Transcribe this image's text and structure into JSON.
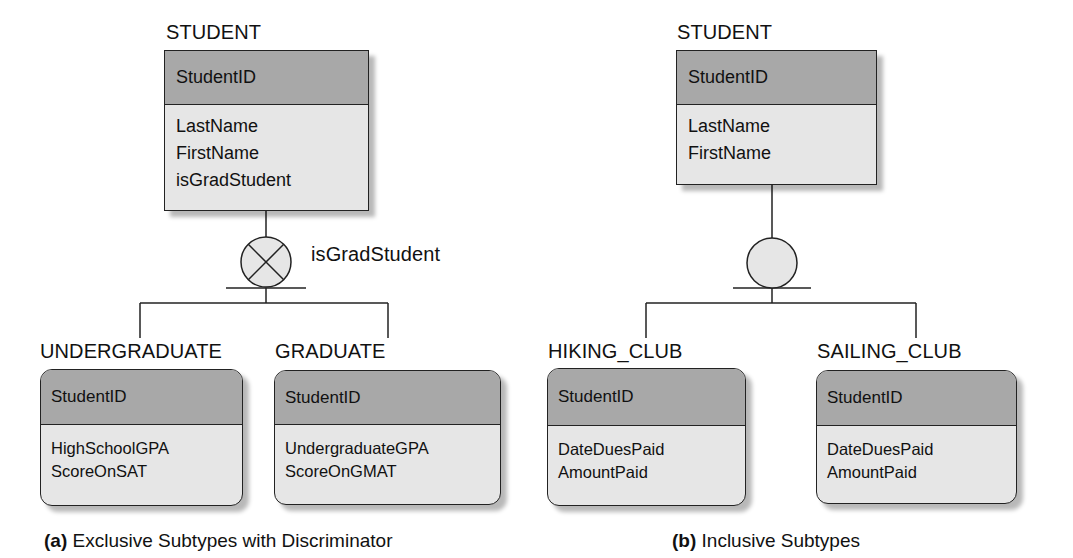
{
  "diagrams": [
    {
      "caption_prefix": "(a)",
      "caption_text": "Exclusive Subtypes with Discriminator",
      "supertype": {
        "name": "STUDENT",
        "identifier": "StudentID",
        "attributes": [
          "LastName",
          "FirstName",
          "isGradStudent"
        ]
      },
      "category_symbol": "exclusive-x-circle",
      "discriminator": "isGradStudent",
      "subtypes": [
        {
          "name": "UNDERGRADUATE",
          "identifier": "StudentID",
          "attributes": [
            "HighSchoolGPA",
            "ScoreOnSAT"
          ]
        },
        {
          "name": "GRADUATE",
          "identifier": "StudentID",
          "attributes": [
            "UndergraduateGPA",
            "ScoreOnGMAT"
          ]
        }
      ]
    },
    {
      "caption_prefix": "(b)",
      "caption_text": "Inclusive Subtypes",
      "supertype": {
        "name": "STUDENT",
        "identifier": "StudentID",
        "attributes": [
          "LastName",
          "FirstName"
        ]
      },
      "category_symbol": "inclusive-circle",
      "subtypes": [
        {
          "name": "HIKING_CLUB",
          "identifier": "StudentID",
          "attributes": [
            "DateDuesPaid",
            "AmountPaid"
          ]
        },
        {
          "name": "SAILING_CLUB",
          "identifier": "StudentID",
          "attributes": [
            "DateDuesPaid",
            "AmountPaid"
          ]
        }
      ]
    }
  ],
  "colors": {
    "header_fill": "#a8a8a8",
    "body_fill": "#e6e6e6",
    "line": "#222222"
  }
}
